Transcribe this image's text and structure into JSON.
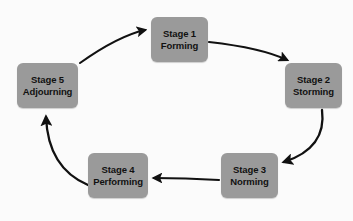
{
  "diagram": {
    "background_color": "#fbfbfb",
    "box_fill_color": "#9a9a9a",
    "box_text_color": "#111111",
    "arrow_color": "#111111",
    "stages": [
      {
        "id": "stage-1",
        "stage_label": "Stage 1",
        "name_label": "Forming",
        "x": 151,
        "y": 17,
        "width": 57,
        "height": 45
      },
      {
        "id": "stage-2",
        "stage_label": "Stage 2",
        "name_label": "Storming",
        "x": 285,
        "y": 63,
        "width": 57,
        "height": 45
      },
      {
        "id": "stage-3",
        "stage_label": "Stage 3",
        "name_label": "Norming",
        "x": 221,
        "y": 153,
        "width": 57,
        "height": 45
      },
      {
        "id": "stage-4",
        "stage_label": "Stage 4",
        "name_label": "Performing",
        "x": 88,
        "y": 153,
        "width": 60,
        "height": 45
      },
      {
        "id": "stage-5",
        "stage_label": "Stage 5",
        "name_label": "Adjourning",
        "x": 17,
        "y": 63,
        "width": 61,
        "height": 45
      }
    ],
    "arrows": [
      {
        "id": "arrow-stage5-to-stage1",
        "from": "Stage 5 Adjourning",
        "to": "Stage 1 Forming",
        "path": "M 80 63 Q 118 36 145 30"
      },
      {
        "id": "arrow-stage1-to-stage2",
        "from": "Stage 1 Forming",
        "to": "Stage 2 Storming",
        "path": "M 209 42 Q 262 48 287 60"
      },
      {
        "id": "arrow-stage2-to-stage3",
        "from": "Stage 2 Storming",
        "to": "Stage 3 Norming",
        "path": "M 322 110 Q 327 148 284 162"
      },
      {
        "id": "arrow-stage3-to-stage4",
        "from": "Stage 3 Norming",
        "to": "Stage 4 Performing",
        "path": "M 219 180 Q 185 178 154 178"
      },
      {
        "id": "arrow-stage4-to-stage5",
        "from": "Stage 4 Performing",
        "to": "Stage 5 Adjourning",
        "path": "M 88 185 Q 48 168 46 117"
      }
    ]
  }
}
